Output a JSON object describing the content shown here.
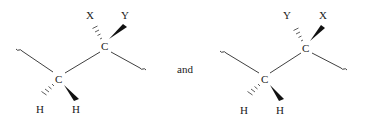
{
  "diagram": {
    "type": "stereochemistry-comparison",
    "conjunction": "and",
    "structures": [
      {
        "id": "left",
        "upper_carbon": {
          "label": "C",
          "hashed_substituent": "X",
          "wedged_substituent": "Y"
        },
        "lower_carbon": {
          "label": "C",
          "hashed_substituent": "H",
          "wedged_substituent": "H"
        }
      },
      {
        "id": "right",
        "upper_carbon": {
          "label": "C",
          "hashed_substituent": "Y",
          "wedged_substituent": "X"
        },
        "lower_carbon": {
          "label": "C",
          "hashed_substituent": "H",
          "wedged_substituent": "H"
        }
      }
    ]
  }
}
